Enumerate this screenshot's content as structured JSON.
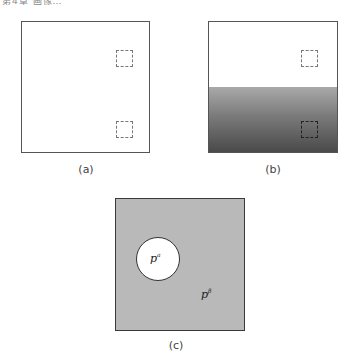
{
  "header": {
    "text": "第4章 画像…"
  },
  "panels": [
    {
      "id": "a",
      "caption": "(a)",
      "fill": "#ffffff",
      "regions": [
        "upper dashed square",
        "lower dashed square"
      ]
    },
    {
      "id": "b",
      "caption": "(b)",
      "fill_top": "#ffffff",
      "gradient": {
        "from": "#a9a9a9",
        "to": "#4a4a4a",
        "direction": "top-to-bottom"
      },
      "regions": [
        "upper dashed square",
        "lower dashed square"
      ]
    },
    {
      "id": "c",
      "caption": "(c)",
      "fill": "#b9b9b9",
      "circle_fill": "#ffffff",
      "labels": {
        "inside_base": "p",
        "inside_sup": "a",
        "outside_base": "p",
        "outside_sup": "β"
      }
    }
  ]
}
